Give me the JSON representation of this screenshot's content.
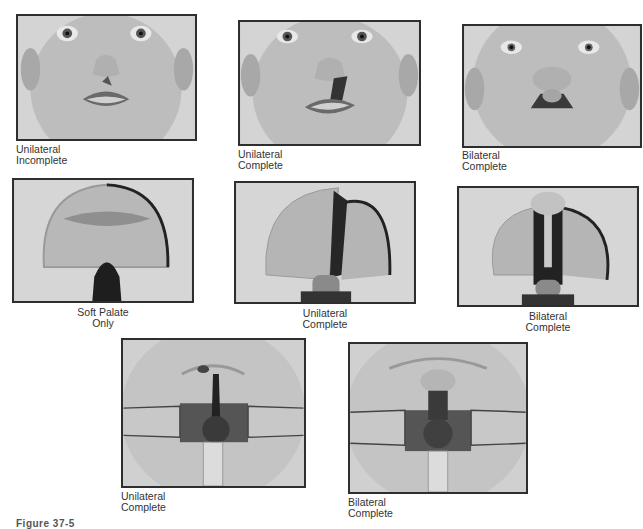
{
  "figure": {
    "label": "Figure 37-5",
    "panels": [
      {
        "id": "face-unilateral-incomplete",
        "view": "face",
        "caption": [
          "Unilateral",
          "Incomplete"
        ]
      },
      {
        "id": "face-unilateral-complete",
        "view": "face",
        "caption": [
          "Unilateral",
          "Complete"
        ]
      },
      {
        "id": "face-bilateral-complete",
        "view": "face",
        "caption": [
          "Bilateral",
          "Complete"
        ]
      },
      {
        "id": "palate-soft-palate-only",
        "view": "palate",
        "caption": [
          "Soft Palate",
          "Only"
        ]
      },
      {
        "id": "palate-unilateral-complete",
        "view": "palate",
        "caption": [
          "Unilateral",
          "Complete"
        ]
      },
      {
        "id": "palate-bilateral-complete",
        "view": "palate",
        "caption": [
          "Bilateral",
          "Complete"
        ]
      },
      {
        "id": "oral-unilateral-complete",
        "view": "retracted-mouth",
        "caption": [
          "Unilateral",
          "Complete"
        ]
      },
      {
        "id": "oral-bilateral-complete",
        "view": "retracted-mouth",
        "caption": [
          "Bilateral",
          "Complete"
        ]
      }
    ]
  }
}
